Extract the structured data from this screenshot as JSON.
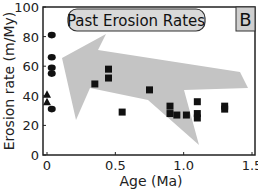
{
  "chart_data": {
    "type": "scatter",
    "title": "Past Erosion Rates",
    "panel_label": "B",
    "xlabel": "Age (Ma)",
    "ylabel": "Erosion rate (m/My)",
    "xlim": [
      0,
      1.5
    ],
    "ylim": [
      0,
      100
    ],
    "xticks": [
      "0",
      "0.5",
      "1.0",
      "1.5"
    ],
    "yticks": [
      "0",
      "20",
      "40",
      "60",
      "80",
      "100"
    ],
    "grid": false,
    "legend": null,
    "annotations": [
      "Large gray arrow pointing from old/low erosion rates toward young/high erosion rates"
    ],
    "series": [
      {
        "name": "circles (modern)",
        "marker": "circle",
        "points": [
          [
            0.02,
            81
          ],
          [
            0.02,
            66
          ],
          [
            0.02,
            59
          ],
          [
            0.02,
            55
          ],
          [
            0.02,
            31
          ]
        ]
      },
      {
        "name": "triangles (modern)",
        "marker": "triangle",
        "points": [
          [
            0.0,
            41
          ],
          [
            0.0,
            36
          ]
        ]
      },
      {
        "name": "squares (past)",
        "marker": "square",
        "points": [
          [
            0.35,
            48
          ],
          [
            0.45,
            58
          ],
          [
            0.45,
            52
          ],
          [
            0.55,
            29
          ],
          [
            0.75,
            44
          ],
          [
            0.9,
            33
          ],
          [
            0.9,
            28
          ],
          [
            0.95,
            27
          ],
          [
            1.02,
            27
          ],
          [
            1.1,
            36
          ],
          [
            1.1,
            28
          ],
          [
            1.1,
            25
          ],
          [
            1.3,
            33
          ],
          [
            1.3,
            31
          ]
        ]
      }
    ],
    "colors": {
      "markers": "#111111",
      "arrow": "#c4c4c4",
      "title_box": "#d9d9d9",
      "panel_box": "#cfcfcf"
    }
  }
}
